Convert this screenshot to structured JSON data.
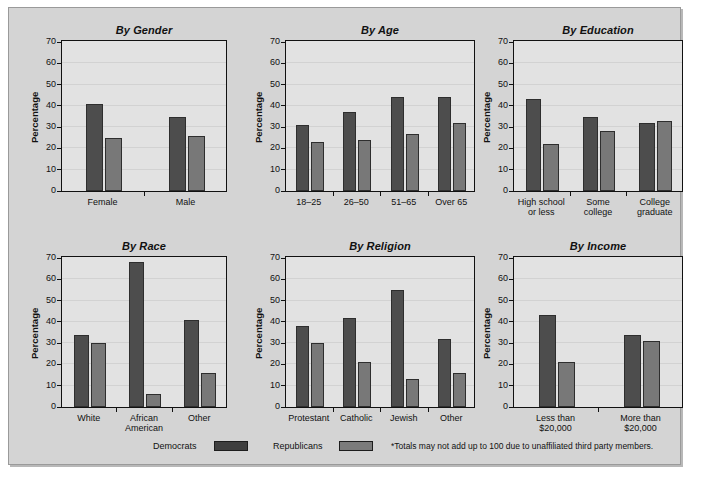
{
  "legend": {
    "democrats_label": "Democrats",
    "republicans_label": "Republicans",
    "footnote": "*Totals may not add up to 100 due to unaffiliated third party members.",
    "democrats_color": "#4d4d4d",
    "republicans_color": "#787878"
  },
  "axis": {
    "ylabel": "Percentage",
    "yticks": [
      "0",
      "10",
      "20",
      "30",
      "40",
      "50",
      "60",
      "70"
    ],
    "ymin": 0,
    "ymax": 70
  },
  "chart_data": [
    {
      "type": "bar",
      "title": "By Gender",
      "categories": [
        "Female",
        "Male"
      ],
      "series": [
        {
          "name": "Democrats",
          "values": [
            41,
            35
          ]
        },
        {
          "name": "Republicans",
          "values": [
            25,
            26
          ]
        }
      ],
      "xlabel": "",
      "ylabel": "Percentage",
      "ylim": [
        0,
        70
      ],
      "grid": true,
      "legend_position": "bottom"
    },
    {
      "type": "bar",
      "title": "By Age",
      "categories": [
        "18–25",
        "26–50",
        "51–65",
        "Over 65"
      ],
      "series": [
        {
          "name": "Democrats",
          "values": [
            31,
            37,
            44,
            44
          ]
        },
        {
          "name": "Republicans",
          "values": [
            23,
            24,
            27,
            32
          ]
        }
      ],
      "xlabel": "",
      "ylabel": "Percentage",
      "ylim": [
        0,
        70
      ],
      "grid": true,
      "legend_position": "bottom"
    },
    {
      "type": "bar",
      "title": "By Education",
      "categories": [
        "High school or less",
        "Some college",
        "College graduate"
      ],
      "category_lines": [
        [
          "High school",
          "or less"
        ],
        [
          "Some",
          "college"
        ],
        [
          "College",
          "graduate"
        ]
      ],
      "series": [
        {
          "name": "Democrats",
          "values": [
            43,
            35,
            32
          ]
        },
        {
          "name": "Republicans",
          "values": [
            22,
            28,
            33
          ]
        }
      ],
      "xlabel": "",
      "ylabel": "Percentage",
      "ylim": [
        0,
        70
      ],
      "grid": true,
      "legend_position": "bottom"
    },
    {
      "type": "bar",
      "title": "By Race",
      "categories": [
        "White",
        "African American",
        "Other"
      ],
      "category_lines": [
        [
          "White",
          ""
        ],
        [
          "African",
          "American"
        ],
        [
          "Other",
          ""
        ]
      ],
      "series": [
        {
          "name": "Democrats",
          "values": [
            34,
            68,
            41
          ]
        },
        {
          "name": "Republicans",
          "values": [
            30,
            6,
            16
          ]
        }
      ],
      "xlabel": "",
      "ylabel": "Percentage",
      "ylim": [
        0,
        70
      ],
      "grid": true,
      "legend_position": "bottom"
    },
    {
      "type": "bar",
      "title": "By Religion",
      "categories": [
        "Protestant",
        "Catholic",
        "Jewish",
        "Other"
      ],
      "series": [
        {
          "name": "Democrats",
          "values": [
            38,
            42,
            55,
            32
          ]
        },
        {
          "name": "Republicans",
          "values": [
            30,
            21,
            13,
            16
          ]
        }
      ],
      "xlabel": "",
      "ylabel": "Percentage",
      "ylim": [
        0,
        70
      ],
      "grid": true,
      "legend_position": "bottom"
    },
    {
      "type": "bar",
      "title": "By Income",
      "categories": [
        "Less than $20,000",
        "More than $20,000"
      ],
      "category_lines": [
        [
          "Less than",
          "$20,000"
        ],
        [
          "More than",
          "$20,000"
        ]
      ],
      "series": [
        {
          "name": "Democrats",
          "values": [
            43,
            34
          ]
        },
        {
          "name": "Republicans",
          "values": [
            21,
            31
          ]
        }
      ],
      "xlabel": "",
      "ylabel": "Percentage",
      "ylim": [
        0,
        70
      ],
      "grid": true,
      "legend_position": "bottom"
    }
  ]
}
